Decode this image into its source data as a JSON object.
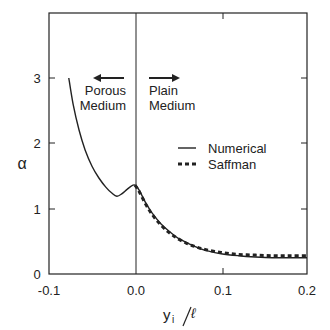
{
  "chart_data": {
    "type": "line",
    "title": "",
    "xlabel": "y_i/ℓ",
    "ylabel": "α",
    "xlim": [
      -0.1,
      0.2
    ],
    "ylim": [
      0,
      4
    ],
    "x_ticks": [
      "-0.1",
      "0.0",
      "0.1",
      "0.2"
    ],
    "y_ticks": [
      "0",
      "1",
      "2",
      "3"
    ],
    "grid": false,
    "legend_position": "center-right",
    "annotations": [
      {
        "text": "Porous Medium",
        "arrow": "left",
        "x": -0.03,
        "y": 2.8
      },
      {
        "text": "Plain Medium",
        "arrow": "right",
        "x": 0.02,
        "y": 2.8
      }
    ],
    "vertical_line": {
      "x": 0.0
    },
    "series": [
      {
        "name": "Numerical",
        "style": "solid",
        "x": [
          -0.077,
          -0.072,
          -0.065,
          -0.058,
          -0.05,
          -0.042,
          -0.034,
          -0.027,
          -0.021,
          -0.015,
          -0.009,
          -0.004,
          0.0,
          0.005,
          0.012,
          0.02,
          0.03,
          0.04,
          0.05,
          0.06,
          0.07,
          0.08,
          0.1,
          0.12,
          0.14,
          0.16,
          0.18,
          0.2
        ],
        "y": [
          3.0,
          2.6,
          2.2,
          1.9,
          1.65,
          1.47,
          1.33,
          1.24,
          1.19,
          1.23,
          1.3,
          1.35,
          1.36,
          1.28,
          1.1,
          0.93,
          0.77,
          0.65,
          0.55,
          0.48,
          0.42,
          0.37,
          0.31,
          0.28,
          0.26,
          0.25,
          0.25,
          0.25
        ]
      },
      {
        "name": "Saffman",
        "style": "dashed",
        "x": [
          0.0,
          0.005,
          0.012,
          0.02,
          0.03,
          0.04,
          0.05,
          0.06,
          0.07,
          0.08,
          0.1,
          0.12,
          0.14,
          0.16,
          0.18,
          0.2
        ],
        "y": [
          1.36,
          1.26,
          1.08,
          0.91,
          0.75,
          0.63,
          0.54,
          0.47,
          0.42,
          0.38,
          0.33,
          0.3,
          0.29,
          0.28,
          0.28,
          0.28
        ]
      }
    ]
  },
  "legend": {
    "items": [
      {
        "label": "Numerical",
        "style": "solid"
      },
      {
        "label": "Saffman",
        "style": "dashed"
      }
    ]
  },
  "annotations": {
    "porous_line1": "Porous",
    "porous_line2": "Medium",
    "plain_line1": "Plain",
    "plain_line2": "Medium"
  },
  "axes": {
    "xlabel_main": "y",
    "xlabel_sub": "i",
    "xlabel_den": "ℓ",
    "ylabel": "α",
    "x_ticks": [
      "-0.1",
      "0.0",
      "0.1",
      "0.2"
    ],
    "y_ticks": [
      "0",
      "1",
      "2",
      "3"
    ]
  }
}
